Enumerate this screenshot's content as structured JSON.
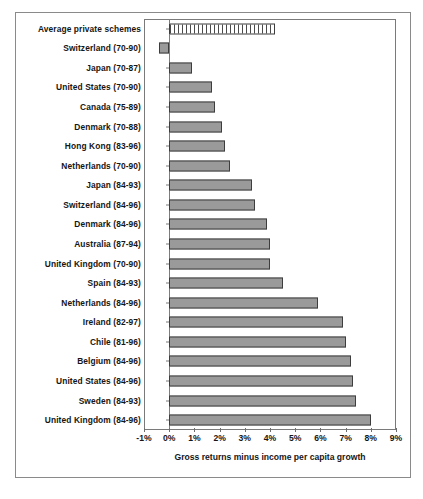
{
  "chart_data": {
    "type": "bar",
    "orientation": "horizontal",
    "title": "",
    "xlabel": "Gross returns minus income per capita growth",
    "ylabel": "",
    "xlim": [
      -1,
      9
    ],
    "xticks": [
      "-1%",
      "0%",
      "1%",
      "2%",
      "3%",
      "4%",
      "5%",
      "6%",
      "7%",
      "8%",
      "9%"
    ],
    "xtick_values": [
      -1,
      0,
      1,
      2,
      3,
      4,
      5,
      6,
      7,
      8,
      9
    ],
    "grid": false,
    "legend": "none",
    "categories": [
      "Average private schemes",
      "Switzerland (70-90)",
      "Japan (70-87)",
      "United States (70-90)",
      "Canada (75-89)",
      "Denmark (70-88)",
      "Hong Kong (83-96)",
      "Netherlands (70-90)",
      "Japan (84-93)",
      "Switzerland (84-96)",
      "Denmark (84-96)",
      "Australia (87-94)",
      "United Kingdom (70-90)",
      "Spain (84-93)",
      "Netherlands (84-96)",
      "Ireland (82-97)",
      "Chile (81-96)",
      "Belgium (84-96)",
      "United States (84-96)",
      "Sweden (84-93)",
      "United Kingdom (84-96)"
    ],
    "values": [
      4.2,
      -0.4,
      0.9,
      1.7,
      1.8,
      2.1,
      2.2,
      2.4,
      3.3,
      3.4,
      3.9,
      4.0,
      4.0,
      4.5,
      5.9,
      6.9,
      7.0,
      7.2,
      7.3,
      7.4,
      8.0
    ],
    "bar_styles": [
      "hatched",
      "solid",
      "solid",
      "solid",
      "solid",
      "solid",
      "solid",
      "solid",
      "solid",
      "solid",
      "solid",
      "solid",
      "solid",
      "solid",
      "solid",
      "solid",
      "solid",
      "solid",
      "solid",
      "solid",
      "solid"
    ],
    "colors": {
      "bar_fill": "#9a9a9a",
      "bar_border": "#3d3d3d",
      "hatch_fill": "#ffffff",
      "hatch_line": "#4a4a4a",
      "axis": "#7a7a7a",
      "frame": "#8a8a8a",
      "text": "#161616",
      "background": "#ffffff"
    }
  },
  "caption": ""
}
